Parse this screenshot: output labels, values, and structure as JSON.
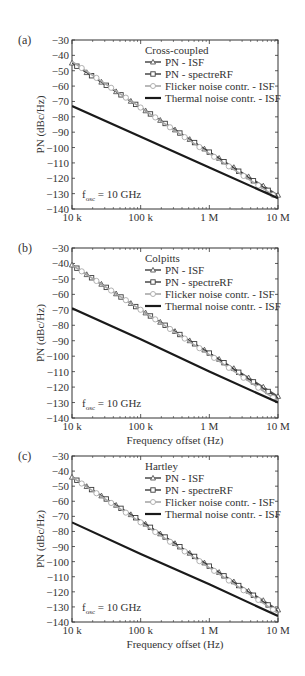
{
  "figure": {
    "x_ticks": [
      "10 k",
      "100 k",
      "1 M",
      "10 M"
    ],
    "y_ticks": [
      "-30",
      "-40",
      "-50",
      "-60",
      "-70",
      "-80",
      "-90",
      "-100",
      "-110",
      "-120",
      "-130",
      "-140"
    ],
    "xlabel": "Frequency offset (Hz)",
    "ylabel": "PN (dBc/Hz)",
    "annotation_main": "f",
    "annotation_sub": "osc",
    "annotation_rest": " = 10 GHz",
    "legend": [
      "PN - ISF",
      "PN - spectreRF",
      "Flicker noise contr. - ISF",
      "Thermal noise contr. - ISF"
    ],
    "colors": {
      "pn_isf": "#555555",
      "pn_spectre": "#3a3a3a",
      "flicker": "#a8a8a8",
      "thermal": "#1a1a1a"
    }
  },
  "panels": [
    {
      "label": "(a)",
      "title": "Cross-coupled"
    },
    {
      "label": "(b)",
      "title": "Colpitts"
    },
    {
      "label": "(c)",
      "title": "Hartley"
    }
  ],
  "chart_data": [
    {
      "type": "line",
      "title": "(a) Cross-coupled",
      "xlabel": "Frequency offset (Hz)",
      "ylabel": "PN (dBc/Hz)",
      "xscale": "log",
      "xlim": [
        10000,
        10000000
      ],
      "ylim": [
        -140,
        -30
      ],
      "x_tick_labels": [
        "10 k",
        "100 k",
        "1 M",
        "10 M"
      ],
      "annotation": "f_osc = 10 GHz",
      "legend_position": "upper right",
      "x": [
        10000,
        100000,
        1000000,
        10000000
      ],
      "series": [
        {
          "name": "PN - ISF",
          "marker": "triangle",
          "values": [
            -45,
            -74,
            -103,
            -131
          ]
        },
        {
          "name": "PN - spectreRF",
          "marker": "square",
          "values": [
            -45,
            -74,
            -103,
            -132
          ]
        },
        {
          "name": "Flicker noise contr. - ISF",
          "marker": "circle",
          "values": [
            -44,
            -74,
            -104,
            -133
          ]
        },
        {
          "name": "Thermal noise contr. - ISF",
          "marker": "none",
          "values": [
            -73,
            -93,
            -113,
            -133
          ]
        }
      ]
    },
    {
      "type": "line",
      "title": "(b) Colpitts",
      "xlabel": "Frequency offset (Hz)",
      "ylabel": "PN (dBc/Hz)",
      "xscale": "log",
      "xlim": [
        10000,
        10000000
      ],
      "ylim": [
        -140,
        -30
      ],
      "x_tick_labels": [
        "10 k",
        "100 k",
        "1 M",
        "10 M"
      ],
      "annotation": "f_osc = 10 GHz",
      "legend_position": "upper right",
      "x": [
        10000,
        100000,
        1000000,
        10000000
      ],
      "series": [
        {
          "name": "PN - ISF",
          "marker": "triangle",
          "values": [
            -41,
            -70,
            -98,
            -126
          ]
        },
        {
          "name": "PN - spectreRF",
          "marker": "square",
          "values": [
            -41,
            -70,
            -98,
            -127
          ]
        },
        {
          "name": "Flicker noise contr. - ISF",
          "marker": "circle",
          "values": [
            -41,
            -70,
            -99,
            -129
          ]
        },
        {
          "name": "Thermal noise contr. - ISF",
          "marker": "none",
          "values": [
            -69,
            -89,
            -110,
            -130
          ]
        }
      ]
    },
    {
      "type": "line",
      "title": "(c) Hartley",
      "xlabel": "Frequency offset (Hz)",
      "ylabel": "PN (dBc/Hz)",
      "xscale": "log",
      "xlim": [
        10000,
        10000000
      ],
      "ylim": [
        -140,
        -30
      ],
      "x_tick_labels": [
        "10 k",
        "100 k",
        "1 M",
        "10 M"
      ],
      "annotation": "f_osc = 10 GHz",
      "legend_position": "upper right",
      "x": [
        10000,
        100000,
        1000000,
        10000000
      ],
      "series": [
        {
          "name": "PN - ISF",
          "marker": "triangle",
          "values": [
            -44,
            -73,
            -103,
            -132
          ]
        },
        {
          "name": "PN - spectreRF",
          "marker": "square",
          "values": [
            -44,
            -73,
            -103,
            -133
          ]
        },
        {
          "name": "Flicker noise contr. - ISF",
          "marker": "circle",
          "values": [
            -44,
            -74,
            -104,
            -134
          ]
        },
        {
          "name": "Thermal noise contr. - ISF",
          "marker": "none",
          "values": [
            -74,
            -95,
            -115,
            -136
          ]
        }
      ]
    }
  ]
}
